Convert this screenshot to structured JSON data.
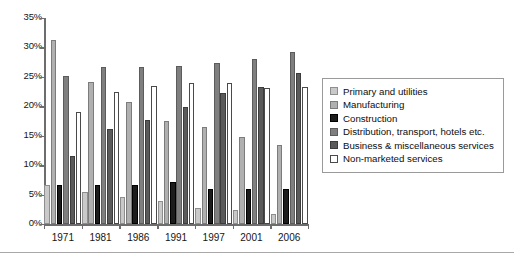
{
  "chart_data": {
    "type": "bar",
    "title": "",
    "xlabel": "",
    "ylabel": "",
    "ylim": [
      0,
      35
    ],
    "ytick_labels": [
      "0%",
      "5%",
      "10%",
      "15%",
      "20%",
      "25%",
      "30%",
      "35%"
    ],
    "ytick_values": [
      0,
      5,
      10,
      15,
      20,
      25,
      30,
      35
    ],
    "grid": false,
    "legend_position": "right",
    "categories": [
      "1971",
      "1981",
      "1986",
      "1991",
      "1997",
      "2001",
      "2006"
    ],
    "series": [
      {
        "name": "Primary and utilities",
        "color": "#c9c9c9",
        "values": [
          6.6,
          5.5,
          4.6,
          3.9,
          2.8,
          2.4,
          1.7
        ]
      },
      {
        "name": "Manufacturing",
        "color": "#b0b0b0",
        "values": [
          31.3,
          24.2,
          20.7,
          17.5,
          16.4,
          14.7,
          13.4
        ]
      },
      {
        "name": "Construction",
        "color": "#1c1c1c",
        "values": [
          6.6,
          6.6,
          6.7,
          7.1,
          6.0,
          6.0,
          6.0
        ]
      },
      {
        "name": "Distribution, transport, hotels etc.",
        "color": "#7f7f7f",
        "values": [
          25.2,
          26.6,
          26.7,
          26.9,
          27.3,
          28.1,
          29.3
        ]
      },
      {
        "name": "Business & miscellaneous services",
        "color": "#5a5a5a",
        "values": [
          11.5,
          16.1,
          17.6,
          19.8,
          22.2,
          23.2,
          25.6
        ]
      },
      {
        "name": "Non-marketed services",
        "color": "#ffffff",
        "values": [
          19.0,
          22.5,
          23.4,
          23.9,
          24.0,
          23.1,
          23.2
        ]
      }
    ]
  }
}
